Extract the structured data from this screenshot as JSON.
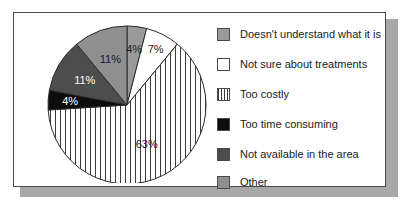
{
  "chart_data": {
    "type": "pie",
    "title": "",
    "legend_position": "right",
    "start_angle_deg": 0,
    "direction": "clockwise",
    "categories": [
      "Doesn't understand what it is",
      "Not sure about treatments",
      "Too costly",
      "Too time consuming",
      "Not available in the area",
      "Other"
    ],
    "values": [
      4,
      7,
      63,
      4,
      11,
      11
    ],
    "value_unit": "%",
    "data_labels": [
      "4%",
      "7%",
      "63%",
      "4%",
      "11%",
      "11%"
    ],
    "slice_styles": [
      {
        "fill": "#9a9a9a",
        "pattern": "solid",
        "label_color": "dark"
      },
      {
        "fill": "#ffffff",
        "pattern": "solid",
        "label_color": "dark"
      },
      {
        "fill": "#ffffff",
        "pattern": "vertical-stripes",
        "label_color": "dark"
      },
      {
        "fill": "#0d0d0d",
        "pattern": "solid",
        "label_color": "light"
      },
      {
        "fill": "#4d4d4d",
        "pattern": "solid",
        "label_color": "light"
      },
      {
        "fill": "#8f8f8f",
        "pattern": "solid",
        "label_color": "dark"
      }
    ]
  },
  "legend": {
    "items": [
      {
        "label": "Doesn't understand what it is",
        "swatch": "solid-gray",
        "color": "#9a9a9a"
      },
      {
        "label": "Not sure about treatments",
        "swatch": "white",
        "color": "#ffffff"
      },
      {
        "label": "Too costly",
        "swatch": "stripes",
        "color": "#ffffff"
      },
      {
        "label": "Too time consuming",
        "swatch": "solid-black",
        "color": "#0d0d0d"
      },
      {
        "label": "Not available in the area",
        "swatch": "solid-dark",
        "color": "#4d4d4d"
      },
      {
        "label": "Other",
        "swatch": "solid-medium",
        "color": "#8f8f8f"
      }
    ]
  },
  "panel": {
    "border_color": "#4a4a4a",
    "shadow_color": "#a8a8a8",
    "background": "#ffffff"
  }
}
